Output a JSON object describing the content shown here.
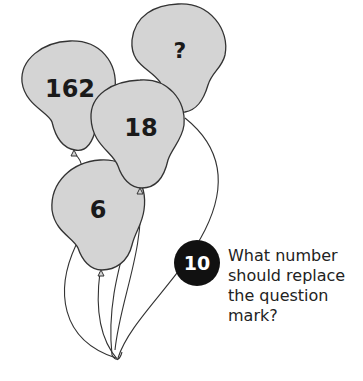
{
  "puzzle": {
    "number": "10",
    "question_lines": [
      "What number",
      "should replace",
      "the question",
      "mark?"
    ],
    "balloons": [
      {
        "id": "unknown",
        "label": "?"
      },
      {
        "id": "top-left",
        "label": "162"
      },
      {
        "id": "middle",
        "label": "18"
      },
      {
        "id": "bottom",
        "label": "6"
      }
    ]
  },
  "colors": {
    "balloon_fill": "#d4d4d4",
    "outline": "#333333",
    "badge": "#111111"
  }
}
